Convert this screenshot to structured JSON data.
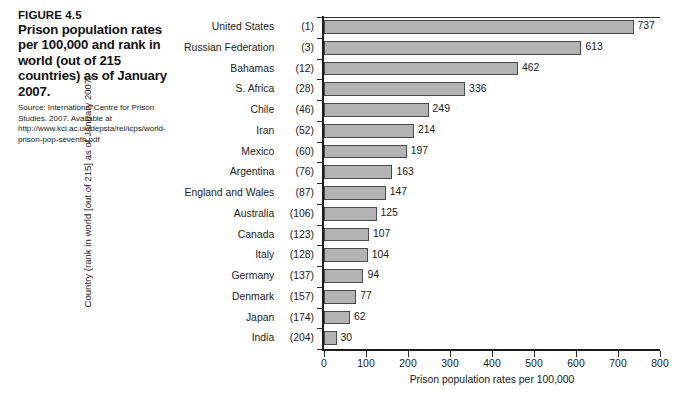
{
  "caption": {
    "figure_number": "FIGURE 4.5",
    "title": "Prison population rates per 100,000 and rank in world (out of 215 countries) as of January 2007.",
    "source": "Source: International Centre for Prison Studies. 2007. Available at http://www.kcl.ac.uk/depsta/rel/icps/world-prison-pop-seventh.pdf"
  },
  "chart_data": {
    "type": "bar",
    "orientation": "horizontal",
    "title": "",
    "xlabel": "Prison population rates per 100,000",
    "ylabel": "Country (rank in world [out of 215] as of January 2007)",
    "xlim": [
      0,
      800
    ],
    "xticks": [
      0,
      100,
      200,
      300,
      400,
      500,
      600,
      700,
      800
    ],
    "grid": false,
    "legend": false,
    "bar_color": "#b3b3b3",
    "bar_edge_color": "#4a4a4a",
    "categories": [
      "United States",
      "Russian Federation",
      "Bahamas",
      "S. Africa",
      "Chile",
      "Iran",
      "Mexico",
      "Argentina",
      "England and Wales",
      "Australia",
      "Canada",
      "Italy",
      "Germany",
      "Denmark",
      "Japan",
      "India"
    ],
    "ranks": [
      "(1)",
      "(3)",
      "(12)",
      "(28)",
      "(46)",
      "(52)",
      "(60)",
      "(76)",
      "(87)",
      "(106)",
      "(123)",
      "(128)",
      "(137)",
      "(157)",
      "(174)",
      "(204)"
    ],
    "values": [
      737,
      613,
      462,
      336,
      249,
      214,
      197,
      163,
      147,
      125,
      107,
      104,
      94,
      77,
      62,
      30
    ]
  }
}
